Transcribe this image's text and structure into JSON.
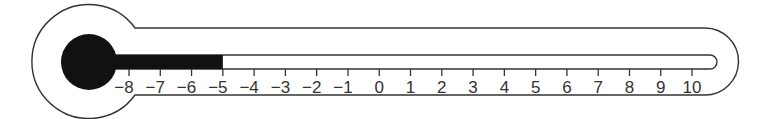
{
  "diagram": {
    "type": "thermometer",
    "scale": {
      "min": -8,
      "max": 10,
      "step": 1,
      "labels": [
        "−8",
        "−7",
        "−6",
        "−5",
        "−4",
        "−3",
        "−2",
        "−1",
        "0",
        "1",
        "2",
        "3",
        "4",
        "5",
        "6",
        "7",
        "8",
        "9",
        "10"
      ]
    },
    "reading": -5,
    "colors": {
      "fill": "#111111",
      "outline": "#333333",
      "background": "#ffffff"
    }
  }
}
